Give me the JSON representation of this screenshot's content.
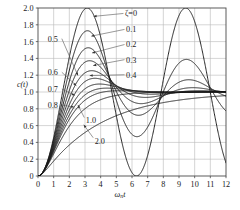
{
  "chart_data": {
    "type": "line",
    "title": "",
    "subtitle": "",
    "xlabel": "ωₙt",
    "xlabel_parts": {
      "omega": "ω",
      "sub": "n",
      "t": "t"
    },
    "ylabel": "c(t)",
    "xlim": [
      0,
      12
    ],
    "ylim": [
      0,
      2.0
    ],
    "xticks": [
      0,
      1,
      2,
      3,
      4,
      5,
      6,
      7,
      8,
      9,
      10,
      11,
      12
    ],
    "xticklabels": [
      "0",
      "1",
      "2",
      "3",
      "4",
      "5",
      "6",
      "7",
      "8",
      "9",
      "10",
      "11",
      "12"
    ],
    "yticks": [
      0,
      0.2,
      0.4,
      0.6,
      0.8,
      1.0,
      1.2,
      1.4,
      1.6,
      1.8,
      2.0
    ],
    "yticklabels": [
      "0",
      "0.2",
      "0.4",
      "0.6",
      "0.8",
      "1.0",
      "1.2",
      "1.4",
      "1.6",
      "1.8",
      "2.0"
    ],
    "grid": true,
    "grid_color": "#b9b9b9",
    "curve_color": "#1a1a1a",
    "frame_color": "#4a4a4a",
    "legend_position": "inline-annotations",
    "series_parameter_symbol": "ζ",
    "series": [
      {
        "name": "ζ=0",
        "zeta": 0.0,
        "label": "ζ=0",
        "peak": 2.0,
        "peak_x": 3.14
      },
      {
        "name": "0.1",
        "zeta": 0.1,
        "label": "0.1",
        "peak": 1.73,
        "peak_x": 3.16
      },
      {
        "name": "0.2",
        "zeta": 0.2,
        "label": "0.2",
        "peak": 1.53,
        "peak_x": 3.21
      },
      {
        "name": "0.3",
        "zeta": 0.3,
        "label": "0.3",
        "peak": 1.37,
        "peak_x": 3.29
      },
      {
        "name": "0.4",
        "zeta": 0.4,
        "label": "0.4",
        "peak": 1.25,
        "peak_x": 3.43
      },
      {
        "name": "0.5",
        "zeta": 0.5,
        "label": "0.5",
        "peak": 1.16,
        "peak_x": 3.63
      },
      {
        "name": "0.6",
        "zeta": 0.6,
        "label": "0.6",
        "peak": 1.09,
        "peak_x": 3.93
      },
      {
        "name": "0.7",
        "zeta": 0.7,
        "label": "0.7",
        "peak": 1.05,
        "peak_x": 4.4
      },
      {
        "name": "0.8",
        "zeta": 0.8,
        "label": "0.8",
        "peak": 1.02,
        "peak_x": 5.24
      },
      {
        "name": "1.0",
        "zeta": 1.0,
        "label": "1.0",
        "peak": 1.0,
        "peak_x": 12.0
      },
      {
        "name": "2.0",
        "zeta": 2.0,
        "label": "2.0",
        "peak": 1.0,
        "peak_x": 12.0
      }
    ],
    "annotations": [
      {
        "text": "ζ=0",
        "label_x": 5.55,
        "label_y": 1.935,
        "tip_x": 3.55,
        "tip_y": 1.9,
        "side": "right"
      },
      {
        "text": "0.1",
        "label_x": 5.62,
        "label_y": 1.745,
        "tip_x": 3.4,
        "tip_y": 1.665,
        "side": "right"
      },
      {
        "text": "0.2",
        "label_x": 5.62,
        "label_y": 1.565,
        "tip_x": 3.45,
        "tip_y": 1.465,
        "side": "right"
      },
      {
        "text": "0.3",
        "label_x": 5.62,
        "label_y": 1.385,
        "tip_x": 3.52,
        "tip_y": 1.315,
        "side": "right"
      },
      {
        "text": "0.4",
        "label_x": 5.62,
        "label_y": 1.205,
        "tip_x": 3.3,
        "tip_y": 1.195,
        "side": "right"
      },
      {
        "text": "0.5",
        "label_x": 0.62,
        "label_y": 1.635,
        "tip_x": 2.55,
        "tip_y": 1.195,
        "side": "left"
      },
      {
        "text": "0.6",
        "label_x": 0.62,
        "label_y": 1.235,
        "tip_x": 2.45,
        "tip_y": 1.075,
        "side": "left"
      },
      {
        "text": "0.7",
        "label_x": 0.62,
        "label_y": 1.035,
        "tip_x": 2.35,
        "tip_y": 0.96,
        "side": "left"
      },
      {
        "text": "0.8",
        "label_x": 0.62,
        "label_y": 0.845,
        "tip_x": 2.3,
        "tip_y": 0.82,
        "side": "left"
      },
      {
        "text": "1.0",
        "label_x": 3.05,
        "label_y": 0.66,
        "tip_x": 2.55,
        "tip_y": 0.845,
        "side": "below"
      },
      {
        "text": "2.0",
        "label_x": 3.62,
        "label_y": 0.42,
        "tip_x": 2.92,
        "tip_y": 0.61,
        "side": "below"
      }
    ]
  },
  "figure": {
    "background": "#ffffff",
    "plot_left_px": 38,
    "plot_right_px": 226,
    "plot_top_px": 8,
    "plot_bottom_px": 176
  }
}
